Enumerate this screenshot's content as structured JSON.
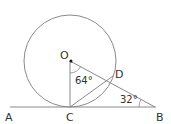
{
  "diagram": {
    "type": "geometry",
    "colors": {
      "stroke": "#8a8a8a",
      "text": "#333333",
      "background": "#ffffff"
    },
    "points": {
      "O": {
        "label": "O",
        "x": 70,
        "y": 61
      },
      "C": {
        "label": "C",
        "x": 70,
        "y": 107
      },
      "D": {
        "label": "D",
        "x": 113,
        "y": 76
      },
      "B": {
        "label": "B",
        "x": 155,
        "y": 107
      },
      "A": {
        "label": "A",
        "x": 10,
        "y": 107
      }
    },
    "circle": {
      "center": "O",
      "radius": 46
    },
    "segments": [
      "AB",
      "OC",
      "OB",
      "CD"
    ],
    "angles": {
      "COD": {
        "label": "64°",
        "vertex": "O"
      },
      "DBC": {
        "label": "32°",
        "vertex": "B"
      }
    }
  }
}
